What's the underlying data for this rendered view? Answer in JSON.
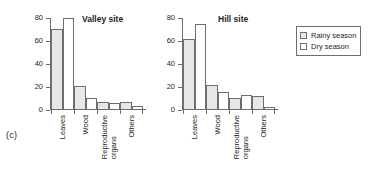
{
  "figure": {
    "panel_letter": "(c)"
  },
  "legend": {
    "position": "right",
    "entries": [
      {
        "label": "Rainy season",
        "swatch": "rainy",
        "color": "#e6e7e8"
      },
      {
        "label": "Dry season",
        "swatch": "dry",
        "color": "#ffffff"
      }
    ]
  },
  "chart_data": [
    {
      "type": "bar",
      "id": "valley",
      "title": "Valley site",
      "xlabel": "",
      "ylabel": "",
      "ylim": [
        0,
        80
      ],
      "yticks": [
        0,
        20,
        40,
        60,
        80
      ],
      "grid": false,
      "legend_position": "right",
      "categories": [
        "Leaves",
        "Wood",
        "Reproductive organs",
        "Others"
      ],
      "series": [
        {
          "name": "Rainy season",
          "values": [
            70,
            20,
            6.5,
            6.5
          ]
        },
        {
          "name": "Dry season",
          "values": [
            79,
            10,
            5,
            2.5
          ]
        }
      ]
    },
    {
      "type": "bar",
      "id": "hill",
      "title": "Hill site",
      "xlabel": "",
      "ylabel": "",
      "ylim": [
        0,
        80
      ],
      "yticks": [
        0,
        20,
        40,
        60,
        80
      ],
      "grid": false,
      "legend_position": "right",
      "categories": [
        "Leaves",
        "Wood",
        "Reproductive organs",
        "Others"
      ],
      "series": [
        {
          "name": "Rainy season",
          "values": [
            61,
            21,
            10,
            11
          ]
        },
        {
          "name": "Dry season",
          "values": [
            74,
            15,
            12,
            2
          ]
        }
      ]
    }
  ]
}
